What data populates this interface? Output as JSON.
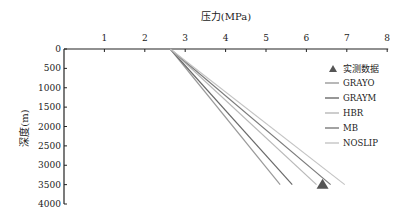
{
  "chart_data": {
    "type": "line",
    "title": "",
    "xlabel": "压力(MPa)",
    "ylabel": "深度(m)",
    "xlim": [
      0,
      8
    ],
    "ylim": [
      0,
      4000
    ],
    "x_ticks": [
      "1",
      "2",
      "3",
      "4",
      "5",
      "6",
      "7",
      "8"
    ],
    "y_ticks": [
      "0",
      "500",
      "1000",
      "1500",
      "2000",
      "2500",
      "3000",
      "3500",
      "4000"
    ],
    "x_axis_position": "top",
    "y_inverted": true,
    "grid": false,
    "legend_position": "right",
    "series": [
      {
        "name": "GRAYO",
        "color": "#9a9a9a",
        "points": [
          [
            2.63,
            0
          ],
          [
            5.35,
            3500
          ]
        ]
      },
      {
        "name": "GRAYM",
        "color": "#6a6a6a",
        "points": [
          [
            2.63,
            0
          ],
          [
            5.65,
            3500
          ]
        ]
      },
      {
        "name": "HBR",
        "color": "#b8b8b8",
        "points": [
          [
            2.63,
            0
          ],
          [
            6.25,
            3500
          ]
        ]
      },
      {
        "name": "MB",
        "color": "#7a7a7a",
        "points": [
          [
            2.63,
            0
          ],
          [
            6.6,
            3500
          ]
        ]
      },
      {
        "name": "NOSLIP",
        "color": "#c4c4c4",
        "points": [
          [
            2.63,
            0
          ],
          [
            6.95,
            3500
          ]
        ]
      }
    ],
    "measured": {
      "name": "实测数据",
      "marker": "triangle",
      "color": "#555555",
      "points": [
        [
          6.4,
          3500
        ]
      ]
    }
  }
}
